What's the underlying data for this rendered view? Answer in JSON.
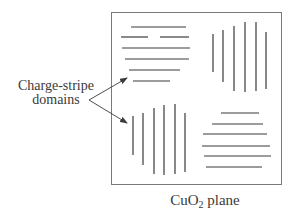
{
  "diagram": {
    "frame_label": {
      "prefix": "CuO",
      "subscript": "2",
      "suffix": " plane"
    },
    "callout_label": {
      "line1": "Charge-stripe",
      "line2": "domains"
    },
    "colors": {
      "stroke": "#3a3a3a",
      "frame": "#7a7a7a",
      "background": "#ffffff"
    },
    "domains": [
      {
        "id": "top-left",
        "orientation": "horizontal",
        "stripe_count": 6
      },
      {
        "id": "top-right",
        "orientation": "vertical",
        "stripe_count": 6
      },
      {
        "id": "bottom-left",
        "orientation": "vertical",
        "stripe_count": 6
      },
      {
        "id": "bottom-right",
        "orientation": "horizontal",
        "stripe_count": 6
      }
    ]
  }
}
